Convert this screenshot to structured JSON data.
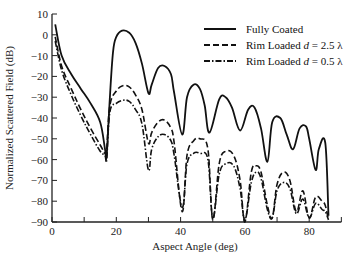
{
  "chart_data": {
    "type": "line",
    "title": "",
    "xlabel": "Aspect Angle (deg)",
    "ylabel": "Normalized Scattered Field (dB)",
    "xlim": [
      0,
      90
    ],
    "ylim": [
      -90,
      10
    ],
    "xticks": [
      0,
      20,
      40,
      60,
      80
    ],
    "xminor_ticks": [
      10,
      30,
      50,
      70,
      90
    ],
    "yticks": [
      10,
      0,
      -10,
      -20,
      -30,
      -40,
      -50,
      -60,
      -70,
      -80,
      -90
    ],
    "grid": false,
    "legend_position": "upper right",
    "series": [
      {
        "name": "Fully Coated",
        "style": "solid",
        "x": [
          1,
          3,
          6,
          9,
          12,
          15,
          16.5,
          17,
          18,
          19,
          20,
          21.8,
          24,
          26,
          28,
          30,
          31,
          33,
          35,
          37,
          38,
          40.5,
          42,
          44,
          46,
          47.5,
          49,
          52,
          54,
          56,
          58.5,
          61,
          63,
          65,
          67,
          68.5,
          71,
          73,
          75,
          77,
          79,
          80,
          82,
          83,
          85,
          86
        ],
        "y": [
          5,
          -10,
          -19,
          -26,
          -33,
          -42,
          -55,
          -58,
          -30,
          -8,
          -1,
          2,
          1,
          -4,
          -14,
          -28,
          -24,
          -16,
          -15,
          -19,
          -28,
          -48,
          -30,
          -24,
          -26,
          -34,
          -47,
          -31,
          -30,
          -35,
          -46,
          -36,
          -35,
          -45,
          -61,
          -42,
          -40,
          -48,
          -55,
          -45,
          -44,
          -50,
          -65,
          -55,
          -52,
          -87
        ]
      },
      {
        "name": "Rim Loaded d = 2.5 λ",
        "style": "dashed",
        "x": [
          1,
          3,
          6,
          9,
          12,
          15,
          16.5,
          17,
          18,
          20,
          22,
          24,
          26,
          28,
          30,
          31,
          33,
          35,
          37,
          38,
          40.5,
          42,
          44,
          46,
          48.5,
          50,
          52,
          54,
          56.5,
          58.5,
          60,
          62,
          63.5,
          65,
          67,
          68.5,
          70,
          72,
          74,
          76,
          78,
          80,
          82,
          84,
          85,
          86
        ],
        "y": [
          -1,
          -15,
          -26,
          -36,
          -45,
          -53,
          -57,
          -55,
          -34,
          -27,
          -24.5,
          -25,
          -29,
          -36,
          -52,
          -47,
          -42,
          -41,
          -45,
          -52,
          -85,
          -58,
          -51,
          -50,
          -55,
          -89,
          -62,
          -56,
          -58,
          -70,
          -90,
          -66,
          -63,
          -66,
          -82,
          -88,
          -72,
          -66,
          -70,
          -85,
          -75,
          -88,
          -78,
          -80,
          -82,
          -89
        ]
      },
      {
        "name": "Rim Loaded d = 0.5 λ",
        "style": "dash-dot",
        "x": [
          1,
          3,
          6,
          9,
          12,
          15,
          16.5,
          17,
          18,
          20,
          22,
          24,
          26,
          28,
          30,
          31,
          33,
          35,
          37,
          38,
          40.5,
          42,
          44,
          46,
          48.5,
          50,
          52,
          54,
          56.5,
          58.5,
          60,
          62,
          63.5,
          65,
          67,
          68.5,
          70,
          72,
          74,
          76,
          78,
          80,
          82,
          84,
          85,
          86
        ],
        "y": [
          -3,
          -17,
          -29,
          -39,
          -48,
          -56,
          -58,
          -60,
          -37,
          -33,
          -31.5,
          -32,
          -36,
          -43,
          -65,
          -55,
          -49,
          -48,
          -51,
          -58,
          -83,
          -62,
          -57,
          -57,
          -60,
          -88,
          -67,
          -62,
          -63,
          -74,
          -89,
          -71,
          -66,
          -69,
          -84,
          -88,
          -75,
          -71,
          -74,
          -86,
          -79,
          -88,
          -81,
          -84,
          -85,
          -89
        ]
      }
    ]
  },
  "legend": {
    "items": [
      {
        "label": "Fully Coated",
        "style": "solid"
      },
      {
        "label": "Rim Loaded d = 2.5 λ",
        "style": "dashed"
      },
      {
        "label": "Rim Loaded d = 0.5 λ",
        "style": "dash-dot"
      }
    ]
  },
  "colors": {
    "line": "#111111",
    "axis": "#222222",
    "background": "#ffffff"
  }
}
